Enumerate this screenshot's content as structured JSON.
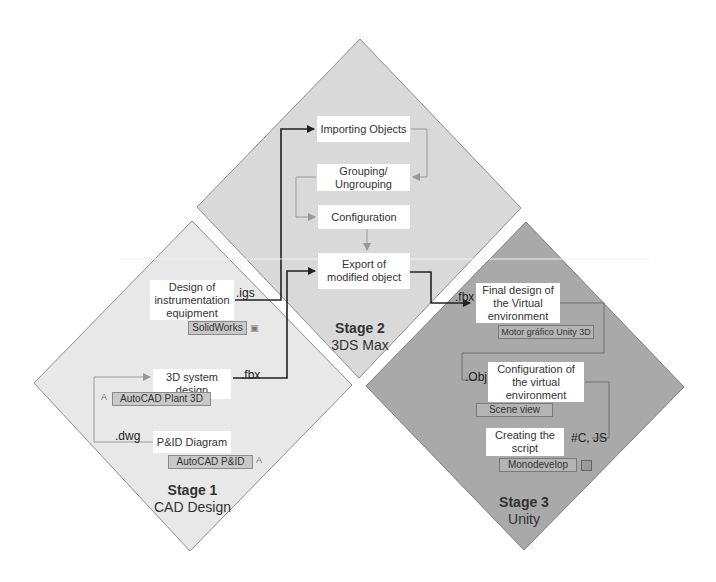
{
  "colors": {
    "background": "#ffffff",
    "stage1_fill": "#e6e6e6",
    "stage2_fill": "#d8d8d8",
    "stage3_fill": "#a8a8a8",
    "diamond_border": "#8c8c8c",
    "main_arrow": "#222222",
    "inner_arrow": "#8a8a8a",
    "box_fill": "#ffffff",
    "tool_fill": "#c8c8c8"
  },
  "stages": [
    {
      "id": "stage1",
      "title": "Stage 1",
      "subtitle": "CAD Design",
      "steps": [
        {
          "label": "Design of instrumentation equipment",
          "tool": "SolidWorks",
          "output_ext": ".igs"
        },
        {
          "label": "3D system design",
          "tool": "AutoCAD Plant 3D",
          "output_ext": ".fbx"
        },
        {
          "label": "P&ID Diagram",
          "tool": "AutoCAD P&ID",
          "output_ext": ".dwg"
        }
      ]
    },
    {
      "id": "stage2",
      "title": "Stage 2",
      "subtitle": "3DS Max",
      "steps": [
        {
          "label": "Importing Objects"
        },
        {
          "label": "Grouping/ Ungrouping"
        },
        {
          "label": "Configuration"
        },
        {
          "label": "Export of modified object"
        }
      ]
    },
    {
      "id": "stage3",
      "title": "Stage 3",
      "subtitle": "Unity",
      "input_ext": ".fbx",
      "steps": [
        {
          "label": "Final design of the Virtual environment",
          "tool": "Motor gráfico Unity 3D"
        },
        {
          "label": "Configuration of the virtual environment",
          "tool": "Scene view",
          "ext": ".Obj"
        },
        {
          "label": "Creating the script",
          "tool": "Monodevelop",
          "ext": "#C, JS"
        }
      ]
    }
  ],
  "icons": {
    "solidworks": "solidworks-icon",
    "autocad_plant": "autocad-icon",
    "autocad_pid": "autocad-icon",
    "monodevelop": "monodevelop-icon"
  }
}
